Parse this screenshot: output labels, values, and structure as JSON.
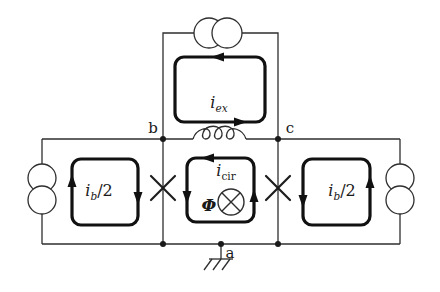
{
  "figure": {
    "kind": "circuit-schematic"
  },
  "colors": {
    "wire": "#2e2e2e",
    "bold_loop": "#111111",
    "background": "#ffffff",
    "text": "#1a1a1a"
  },
  "node_labels": {
    "b": "b",
    "c": "c",
    "a": "a"
  },
  "loop_labels": {
    "top": {
      "base": "i",
      "sub": "ex",
      "suffix": ""
    },
    "center": {
      "base": "i",
      "sub": "cir",
      "suffix": ""
    },
    "left": {
      "base": "i",
      "sub": "b",
      "suffix": "/2"
    },
    "right": {
      "base": "i",
      "sub": "b",
      "suffix": "/2"
    }
  },
  "flux": {
    "symbol": "Φ"
  },
  "components": {
    "current_source_top": "current-source",
    "current_source_left": "current-source",
    "current_source_right": "current-source",
    "inductor": "inductor-coil",
    "junction_left": "josephson-junction",
    "junction_right": "josephson-junction",
    "flux_marker": "flux-into-page",
    "ground": "ground"
  }
}
